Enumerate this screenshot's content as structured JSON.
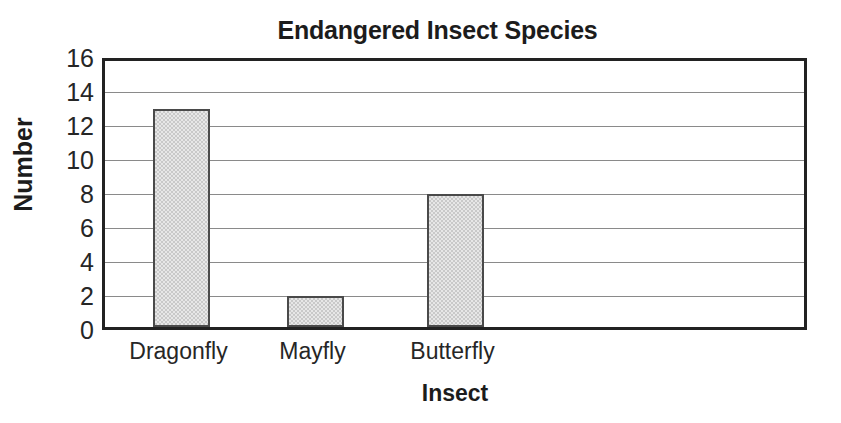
{
  "chart_data": {
    "type": "bar",
    "title": "Endangered Insect Species",
    "xlabel": "Insect",
    "ylabel": "Number",
    "categories": [
      "Dragonfly",
      "Mayfly",
      "Butterfly"
    ],
    "values": [
      13,
      2,
      8
    ],
    "ylim": [
      0,
      16
    ],
    "ytick_step": 2,
    "yticks": [
      0,
      2,
      4,
      6,
      8,
      10,
      12,
      14,
      16
    ],
    "ytick_labels": [
      "0",
      "2",
      "4",
      "6",
      "8",
      "10",
      "12",
      "14",
      "16"
    ],
    "grid": true,
    "grid_axis": "y",
    "legend": false,
    "legend_position": "none",
    "bar_fill_color": "#c9c9c9",
    "bar_edge_color": "#4a4a4a",
    "grid_color": "#8a8a8a",
    "frame_color": "#222222",
    "text_color": "#1c1c1c",
    "background_color": "#ffffff"
  }
}
